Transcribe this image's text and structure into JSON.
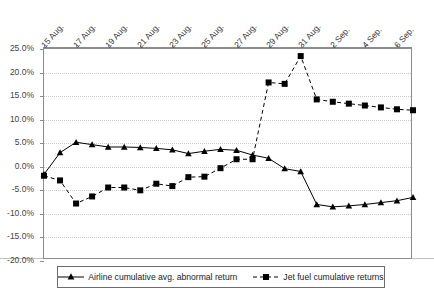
{
  "chart_data": {
    "type": "line",
    "title": "",
    "subtitle": "",
    "xlabel": "",
    "ylabel": "",
    "grid": "horizontal-dotted",
    "legend_position": "bottom",
    "ylim": [
      -20,
      25
    ],
    "ytick_step": 5,
    "ytick_labels": [
      "25.0%",
      "20.0%",
      "15.0%",
      "10.0%",
      "5.0%",
      "0.0%",
      "-5.0%",
      "-10.0%",
      "-15.0%",
      "-20.0%"
    ],
    "ytick_values": [
      25,
      20,
      15,
      10,
      5,
      0,
      -5,
      -10,
      -15,
      -20
    ],
    "x": [
      "15 Aug.",
      "16 Aug.",
      "17 Aug.",
      "18 Aug.",
      "19 Aug.",
      "20 Aug.",
      "21 Aug.",
      "22 Aug.",
      "23 Aug.",
      "24 Aug.",
      "25 Aug.",
      "26 Aug.",
      "27 Aug.",
      "28 Aug.",
      "29 Aug.",
      "30 Aug.",
      "31 Aug.",
      "1 Sep.",
      "2 Sep.",
      "3 Sep.",
      "4 Sep.",
      "5 Sep.",
      "6 Sep.",
      "7 Sep."
    ],
    "xtick_labels": [
      "15 Aug.",
      "17 Aug.",
      "19 Aug.",
      "21 Aug.",
      "23 Aug.",
      "25 Aug.",
      "27 Aug.",
      "29 Aug.",
      "31 Aug.",
      "2 Sep.",
      "4 Sep.",
      "6 Sep."
    ],
    "xtick_indices": [
      0,
      2,
      4,
      6,
      8,
      10,
      12,
      14,
      16,
      18,
      20,
      22
    ],
    "series": [
      {
        "name": "Airline cumulative avg. abnormal return",
        "marker": "triangle",
        "linestyle": "solid",
        "color": "#000000",
        "values": [
          -1.6,
          3.0,
          5.2,
          4.7,
          4.2,
          4.2,
          4.1,
          3.9,
          3.6,
          2.8,
          3.3,
          3.7,
          3.5,
          2.5,
          1.8,
          -0.4,
          -1.0,
          -8.0,
          -8.5,
          -8.3,
          -8.0,
          -7.6,
          -7.2,
          -6.5
        ]
      },
      {
        "name": "Jet fuel cumulative returns",
        "marker": "square",
        "linestyle": "dashed",
        "color": "#000000",
        "values": [
          -1.9,
          -2.9,
          -7.8,
          -6.3,
          -4.4,
          -4.4,
          -5.0,
          -3.6,
          -4.1,
          -2.2,
          -2.1,
          -0.3,
          1.6,
          1.6,
          17.9,
          17.6,
          23.5,
          14.3,
          13.8,
          13.4,
          13.0,
          12.6,
          12.2,
          12.0
        ]
      }
    ]
  },
  "legend": {
    "items": [
      {
        "label": "Airline cumulative avg. abnormal return",
        "marker": "triangle",
        "linestyle": "solid"
      },
      {
        "label": "Jet fuel cumulative returns",
        "marker": "square",
        "linestyle": "dashed"
      }
    ]
  }
}
